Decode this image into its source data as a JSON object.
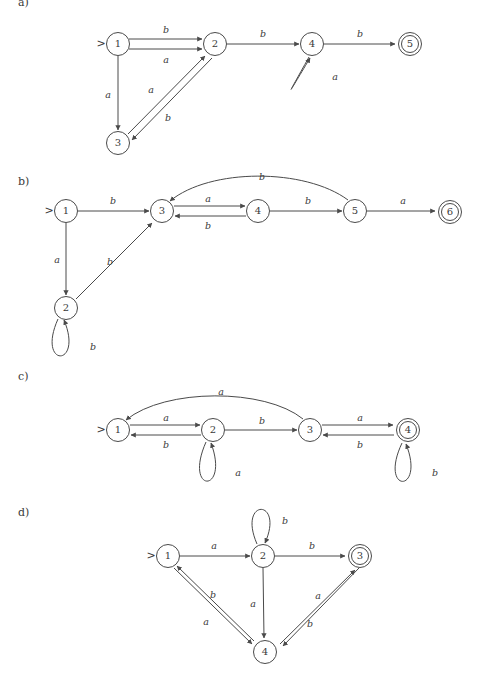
{
  "figure": {
    "caption": "",
    "background_color": "#ffffff",
    "stroke_color": "#4a4a4a",
    "text_color": "#3a3a3a"
  },
  "sections": [
    {
      "id": "a",
      "label": "a)",
      "x": 18,
      "y": 3
    },
    {
      "id": "b",
      "label": "b)",
      "x": 18,
      "y": 182
    },
    {
      "id": "c",
      "label": "c)",
      "x": 18,
      "y": 377
    },
    {
      "id": "d",
      "label": "d)",
      "x": 18,
      "y": 513
    }
  ],
  "automata": [
    {
      "id": "a",
      "start_marker": ">",
      "states": [
        {
          "name": "1",
          "x": 118,
          "y": 44,
          "accepting": false,
          "start": true
        },
        {
          "name": "2",
          "x": 215,
          "y": 44,
          "accepting": false,
          "start": false
        },
        {
          "name": "3",
          "x": 118,
          "y": 143,
          "accepting": false,
          "start": false
        },
        {
          "name": "4",
          "x": 312,
          "y": 44,
          "accepting": false,
          "start": false
        },
        {
          "name": "5",
          "x": 410,
          "y": 44,
          "accepting": true,
          "start": false
        }
      ],
      "transitions": [
        {
          "from": "1",
          "to": "2",
          "symbol": "b",
          "label_x": 166,
          "label_y": 30
        },
        {
          "from": "1",
          "to": "2",
          "symbol": "a",
          "label_x": 166,
          "label_y": 60
        },
        {
          "from": "1",
          "to": "3",
          "symbol": "a",
          "label_x": 108,
          "label_y": 95
        },
        {
          "from": "3",
          "to": "2",
          "symbol": "a",
          "label_x": 151,
          "label_y": 90
        },
        {
          "from": "2",
          "to": "3",
          "symbol": "b",
          "label_x": 168,
          "label_y": 118
        },
        {
          "from": "2",
          "to": "4",
          "symbol": "b",
          "label_x": 263,
          "label_y": 34
        },
        {
          "from": "4",
          "to": "4",
          "symbol": "a",
          "label_x": 335,
          "label_y": 77,
          "self_loop": true
        },
        {
          "from": "4",
          "to": "5",
          "symbol": "b",
          "label_x": 360,
          "label_y": 34
        }
      ]
    },
    {
      "id": "b",
      "start_marker": ">",
      "states": [
        {
          "name": "1",
          "x": 66,
          "y": 211,
          "accepting": false,
          "start": true
        },
        {
          "name": "2",
          "x": 66,
          "y": 308,
          "accepting": false,
          "start": false
        },
        {
          "name": "3",
          "x": 162,
          "y": 211,
          "accepting": false,
          "start": false
        },
        {
          "name": "4",
          "x": 258,
          "y": 211,
          "accepting": false,
          "start": false
        },
        {
          "name": "5",
          "x": 355,
          "y": 211,
          "accepting": false,
          "start": false
        },
        {
          "name": "6",
          "x": 450,
          "y": 212,
          "accepting": true,
          "start": false
        }
      ],
      "transitions": [
        {
          "from": "1",
          "to": "3",
          "symbol": "b",
          "label_x": 113,
          "label_y": 201
        },
        {
          "from": "1",
          "to": "2",
          "symbol": "a",
          "label_x": 57,
          "label_y": 260
        },
        {
          "from": "2",
          "to": "3",
          "symbol": "b",
          "label_x": 110,
          "label_y": 262
        },
        {
          "from": "2",
          "to": "2",
          "symbol": "b",
          "label_x": 93,
          "label_y": 347,
          "self_loop": true
        },
        {
          "from": "3",
          "to": "4",
          "symbol": "a",
          "label_x": 208,
          "label_y": 201
        },
        {
          "from": "4",
          "to": "3",
          "symbol": "b",
          "label_x": 208,
          "label_y": 224
        },
        {
          "from": "4",
          "to": "5",
          "symbol": "b",
          "label_x": 308,
          "label_y": 201
        },
        {
          "from": "5",
          "to": "3",
          "symbol": "b",
          "label_x": 262,
          "label_y": 177,
          "curved": true
        },
        {
          "from": "5",
          "to": "6",
          "symbol": "a",
          "label_x": 403,
          "label_y": 201
        }
      ]
    },
    {
      "id": "c",
      "start_marker": ">",
      "states": [
        {
          "name": "1",
          "x": 118,
          "y": 430,
          "accepting": false,
          "start": true
        },
        {
          "name": "2",
          "x": 213,
          "y": 430,
          "accepting": false,
          "start": false
        },
        {
          "name": "3",
          "x": 310,
          "y": 430,
          "accepting": false,
          "start": false
        },
        {
          "name": "4",
          "x": 408,
          "y": 430,
          "accepting": true,
          "start": false
        }
      ],
      "transitions": [
        {
          "from": "1",
          "to": "2",
          "symbol": "a",
          "label_x": 166,
          "label_y": 420
        },
        {
          "from": "2",
          "to": "1",
          "symbol": "b",
          "label_x": 166,
          "label_y": 443
        },
        {
          "from": "2",
          "to": "3",
          "symbol": "b",
          "label_x": 262,
          "label_y": 421
        },
        {
          "from": "3",
          "to": "1",
          "symbol": "a",
          "label_x": 221,
          "label_y": 392,
          "curved": true
        },
        {
          "from": "3",
          "to": "4",
          "symbol": "a",
          "label_x": 360,
          "label_y": 420
        },
        {
          "from": "4",
          "to": "3",
          "symbol": "b",
          "label_x": 360,
          "label_y": 443
        },
        {
          "from": "2",
          "to": "2",
          "symbol": "a",
          "label_x": 238,
          "label_y": 473,
          "self_loop": true
        },
        {
          "from": "4",
          "to": "4",
          "symbol": "b",
          "label_x": 435,
          "label_y": 473,
          "self_loop": true
        }
      ]
    },
    {
      "id": "d",
      "start_marker": ">",
      "states": [
        {
          "name": "1",
          "x": 168,
          "y": 556,
          "accepting": false,
          "start": true
        },
        {
          "name": "2",
          "x": 263,
          "y": 556,
          "accepting": false,
          "start": false
        },
        {
          "name": "3",
          "x": 360,
          "y": 556,
          "accepting": true,
          "start": false
        },
        {
          "name": "4",
          "x": 265,
          "y": 652,
          "accepting": false,
          "start": false
        }
      ],
      "transitions": [
        {
          "from": "1",
          "to": "2",
          "symbol": "a",
          "label_x": 214,
          "label_y": 546
        },
        {
          "from": "2",
          "to": "3",
          "symbol": "b",
          "label_x": 312,
          "label_y": 546
        },
        {
          "from": "2",
          "to": "2",
          "symbol": "b",
          "label_x": 285,
          "label_y": 521,
          "self_loop": true
        },
        {
          "from": "2",
          "to": "4",
          "symbol": "a",
          "label_x": 253,
          "label_y": 604
        },
        {
          "from": "1",
          "to": "4",
          "symbol": "a",
          "label_x": 206,
          "label_y": 622
        },
        {
          "from": "4",
          "to": "1",
          "symbol": "b",
          "label_x": 213,
          "label_y": 595
        },
        {
          "from": "4",
          "to": "3",
          "symbol": "a",
          "label_x": 318,
          "label_y": 596
        },
        {
          "from": "3",
          "to": "4",
          "symbol": "b",
          "label_x": 310,
          "label_y": 624
        }
      ]
    }
  ]
}
